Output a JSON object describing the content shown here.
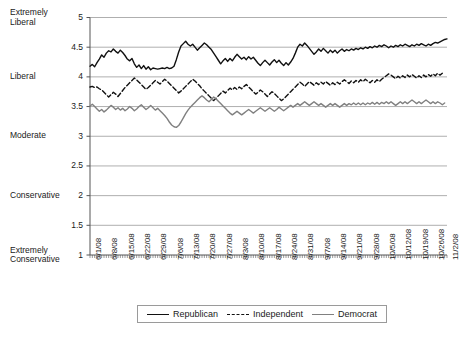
{
  "chart_data": {
    "type": "line",
    "title": "",
    "xlabel": "",
    "ylabel": "",
    "ylim": [
      1,
      5
    ],
    "ytick_values": [
      1,
      1.5,
      2,
      2.5,
      3,
      3.5,
      4,
      4.5,
      5
    ],
    "ytick_labels": [
      "1",
      "1.5",
      "2",
      "2.5",
      "3",
      "3.5",
      "4",
      "4.5",
      "5"
    ],
    "y_category_labels": [
      {
        "value": 5,
        "label": "Extremely\nLiberal"
      },
      {
        "value": 4,
        "label": "Liberal"
      },
      {
        "value": 3,
        "label": "Moderate"
      },
      {
        "value": 2,
        "label": "Conservative"
      },
      {
        "value": 1,
        "label": "Extremely\nConservative"
      }
    ],
    "grid": true,
    "grid_axis": "y",
    "legend_position": "bottom",
    "x_tick_labels": [
      "6/1/08",
      "6/8/08",
      "6/15/08",
      "6/22/08",
      "6/29/08",
      "7/6/08",
      "7/13/08",
      "7/20/08",
      "7/27/08",
      "8/3/08",
      "8/10/08",
      "8/17/08",
      "8/24/08",
      "8/31/08",
      "9/7/08",
      "9/14/08",
      "9/21/08",
      "9/28/08",
      "10/5/08",
      "10/12/08",
      "10/19/08",
      "10/26/08",
      "11/2/08"
    ],
    "x_tick_interval_days": 7,
    "x_start": "6/1/08",
    "x_end": "11/2/08",
    "n_points": 155,
    "series": [
      {
        "name": "Republican",
        "color": "#111111",
        "style": "solid",
        "values": [
          4.18,
          4.21,
          4.17,
          4.24,
          4.3,
          4.37,
          4.33,
          4.4,
          4.44,
          4.42,
          4.47,
          4.43,
          4.4,
          4.45,
          4.41,
          4.36,
          4.3,
          4.27,
          4.31,
          4.22,
          4.16,
          4.2,
          4.14,
          4.19,
          4.13,
          4.17,
          4.12,
          4.15,
          4.14,
          4.13,
          4.14,
          4.15,
          4.14,
          4.16,
          4.14,
          4.15,
          4.18,
          4.29,
          4.42,
          4.52,
          4.56,
          4.6,
          4.55,
          4.52,
          4.55,
          4.5,
          4.45,
          4.49,
          4.53,
          4.57,
          4.54,
          4.5,
          4.46,
          4.4,
          4.34,
          4.28,
          4.22,
          4.27,
          4.31,
          4.26,
          4.31,
          4.27,
          4.33,
          4.38,
          4.34,
          4.3,
          4.33,
          4.29,
          4.34,
          4.3,
          4.33,
          4.28,
          4.23,
          4.19,
          4.24,
          4.28,
          4.24,
          4.2,
          4.25,
          4.29,
          4.24,
          4.28,
          4.23,
          4.19,
          4.24,
          4.2,
          4.25,
          4.31,
          4.4,
          4.5,
          4.55,
          4.52,
          4.57,
          4.53,
          4.48,
          4.43,
          4.38,
          4.42,
          4.47,
          4.43,
          4.48,
          4.44,
          4.4,
          4.45,
          4.41,
          4.45,
          4.4,
          4.44,
          4.47,
          4.43,
          4.46,
          4.44,
          4.47,
          4.45,
          4.48,
          4.46,
          4.49,
          4.47,
          4.5,
          4.48,
          4.51,
          4.49,
          4.52,
          4.5,
          4.53,
          4.51,
          4.54,
          4.52,
          4.49,
          4.52,
          4.5,
          4.53,
          4.51,
          4.54,
          4.52,
          4.55,
          4.53,
          4.51,
          4.54,
          4.52,
          4.55,
          4.53,
          4.56,
          4.54,
          4.52,
          4.55,
          4.53,
          4.56,
          4.58,
          4.57,
          4.59,
          4.61,
          4.63,
          4.64
        ],
        "y_range_observed": [
          4.12,
          4.64
        ]
      },
      {
        "name": "Independent",
        "color": "#111111",
        "style": "dashed",
        "values": [
          3.83,
          3.84,
          3.82,
          3.83,
          3.8,
          3.78,
          3.74,
          3.7,
          3.66,
          3.7,
          3.74,
          3.71,
          3.67,
          3.72,
          3.77,
          3.82,
          3.86,
          3.9,
          3.94,
          3.98,
          3.95,
          3.91,
          3.87,
          3.83,
          3.79,
          3.82,
          3.86,
          3.9,
          3.94,
          3.91,
          3.88,
          3.92,
          3.96,
          3.93,
          3.89,
          3.85,
          3.81,
          3.77,
          3.73,
          3.76,
          3.8,
          3.84,
          3.88,
          3.92,
          3.96,
          3.93,
          3.89,
          3.85,
          3.8,
          3.76,
          3.72,
          3.68,
          3.64,
          3.6,
          3.64,
          3.68,
          3.72,
          3.76,
          3.73,
          3.77,
          3.81,
          3.78,
          3.82,
          3.79,
          3.83,
          3.8,
          3.84,
          3.87,
          3.83,
          3.79,
          3.75,
          3.71,
          3.74,
          3.78,
          3.75,
          3.71,
          3.67,
          3.71,
          3.75,
          3.72,
          3.68,
          3.64,
          3.6,
          3.63,
          3.67,
          3.71,
          3.75,
          3.79,
          3.83,
          3.87,
          3.91,
          3.88,
          3.84,
          3.88,
          3.92,
          3.89,
          3.86,
          3.9,
          3.87,
          3.91,
          3.88,
          3.92,
          3.89,
          3.86,
          3.9,
          3.87,
          3.91,
          3.88,
          3.92,
          3.95,
          3.92,
          3.89,
          3.93,
          3.9,
          3.94,
          3.91,
          3.95,
          3.92,
          3.96,
          3.93,
          3.9,
          3.94,
          3.91,
          3.95,
          3.92,
          3.96,
          3.99,
          4.02,
          4.05,
          4.03,
          4.0,
          3.97,
          4.01,
          3.98,
          4.02,
          3.99,
          4.03,
          4.0,
          4.04,
          4.01,
          3.98,
          4.02,
          3.99,
          4.03,
          4.0,
          4.04,
          4.01,
          4.05,
          4.02,
          4.06,
          4.03,
          4.06
        ],
        "y_range_observed": [
          3.6,
          4.06
        ]
      },
      {
        "name": "Democrat",
        "color": "#808080",
        "style": "solid",
        "values": [
          3.51,
          3.54,
          3.5,
          3.46,
          3.42,
          3.45,
          3.41,
          3.44,
          3.48,
          3.52,
          3.49,
          3.45,
          3.48,
          3.44,
          3.47,
          3.43,
          3.46,
          3.5,
          3.47,
          3.43,
          3.46,
          3.5,
          3.53,
          3.49,
          3.45,
          3.48,
          3.52,
          3.48,
          3.44,
          3.47,
          3.43,
          3.39,
          3.35,
          3.3,
          3.24,
          3.19,
          3.16,
          3.15,
          3.18,
          3.24,
          3.31,
          3.38,
          3.44,
          3.49,
          3.53,
          3.57,
          3.61,
          3.65,
          3.68,
          3.65,
          3.61,
          3.58,
          3.62,
          3.66,
          3.63,
          3.59,
          3.55,
          3.51,
          3.47,
          3.43,
          3.39,
          3.36,
          3.39,
          3.42,
          3.39,
          3.36,
          3.39,
          3.42,
          3.45,
          3.42,
          3.39,
          3.42,
          3.45,
          3.48,
          3.45,
          3.42,
          3.45,
          3.48,
          3.45,
          3.42,
          3.45,
          3.49,
          3.46,
          3.43,
          3.46,
          3.49,
          3.52,
          3.49,
          3.52,
          3.55,
          3.52,
          3.55,
          3.58,
          3.55,
          3.52,
          3.55,
          3.58,
          3.55,
          3.52,
          3.55,
          3.52,
          3.49,
          3.52,
          3.55,
          3.52,
          3.55,
          3.52,
          3.49,
          3.52,
          3.55,
          3.52,
          3.55,
          3.53,
          3.56,
          3.53,
          3.56,
          3.53,
          3.56,
          3.53,
          3.56,
          3.54,
          3.57,
          3.54,
          3.57,
          3.54,
          3.57,
          3.55,
          3.58,
          3.55,
          3.58,
          3.55,
          3.52,
          3.55,
          3.58,
          3.55,
          3.58,
          3.55,
          3.58,
          3.61,
          3.58,
          3.55,
          3.58,
          3.55,
          3.58,
          3.61,
          3.58,
          3.55,
          3.58,
          3.55,
          3.58,
          3.56,
          3.53,
          3.56
        ],
        "y_range_observed": [
          3.15,
          3.68
        ]
      }
    ]
  },
  "legend": {
    "items": [
      {
        "label": "Republican",
        "style": "solid-dark"
      },
      {
        "label": "Independent",
        "style": "dashed"
      },
      {
        "label": "Democrat",
        "style": "solid-gray"
      }
    ]
  },
  "colors": {
    "republican": "#111111",
    "independent": "#111111",
    "democrat": "#808080",
    "grid": "#9a9a9a",
    "axis": "#555555",
    "background": "#ffffff"
  }
}
